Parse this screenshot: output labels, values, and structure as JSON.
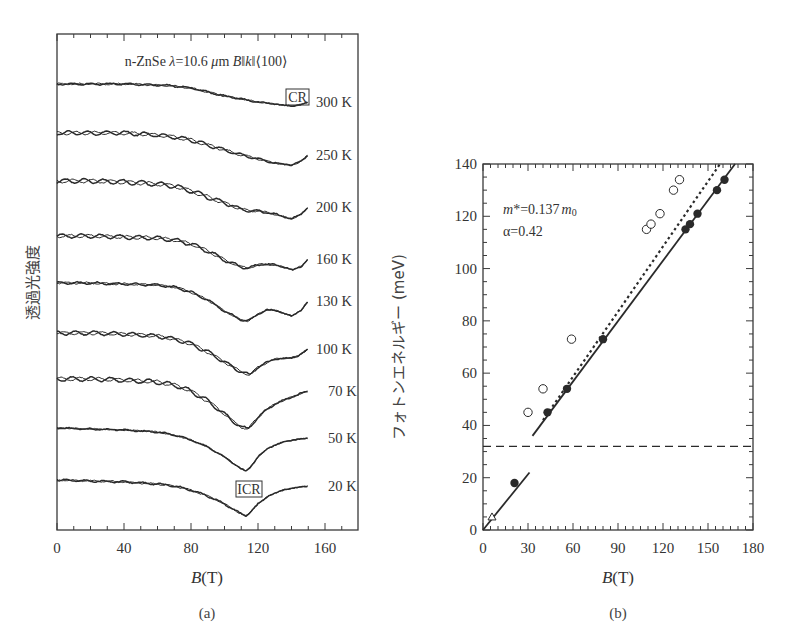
{
  "chart_data": [
    {
      "panel": "(a)",
      "type": "line",
      "title": "n-ZnSe λ=10.6 μm B‖k‖⟨100⟩",
      "xlabel": "B(T)",
      "ylabel": "透過光強度",
      "xlim": [
        0,
        175
      ],
      "xticks": [
        0,
        40,
        80,
        120,
        160
      ],
      "grid": false,
      "annotations": [
        "CR",
        "ICR"
      ],
      "series": [
        {
          "name": "300 K",
          "baseline_y": 84,
          "dips": [
            {
              "B": 140,
              "depth": 22
            }
          ],
          "x": [
            0,
            20,
            40,
            60,
            70,
            80,
            90,
            100,
            110,
            120,
            130,
            140,
            145,
            150
          ],
          "rel": [
            0,
            0,
            0,
            -1,
            -2,
            -4,
            -8,
            -12,
            -15,
            -18,
            -20,
            -22,
            -21,
            -18
          ]
        },
        {
          "name": "250 K",
          "baseline_y": 133,
          "dips": [
            {
              "B": 140,
              "depth": 32
            }
          ],
          "x": [
            0,
            20,
            40,
            60,
            70,
            80,
            90,
            100,
            110,
            120,
            130,
            140,
            145,
            150
          ],
          "rel": [
            0,
            0,
            0,
            -2,
            -4,
            -7,
            -12,
            -17,
            -22,
            -26,
            -30,
            -32,
            -29,
            -22
          ]
        },
        {
          "name": "200 K",
          "baseline_y": 181,
          "dips": [
            {
              "B": 115,
              "depth": 30
            },
            {
              "B": 140,
              "depth": 38
            }
          ],
          "x": [
            0,
            20,
            40,
            60,
            70,
            80,
            90,
            100,
            110,
            115,
            120,
            130,
            140,
            145,
            150
          ],
          "rel": [
            0,
            0,
            -1,
            -3,
            -5,
            -10,
            -16,
            -22,
            -28,
            -30,
            -30,
            -33,
            -38,
            -34,
            -26
          ]
        },
        {
          "name": "160 K",
          "baseline_y": 236,
          "dips": [
            {
              "B": 114,
              "depth": 32
            },
            {
              "B": 141,
              "depth": 34
            }
          ],
          "x": [
            0,
            20,
            40,
            60,
            70,
            80,
            90,
            100,
            110,
            114,
            120,
            125,
            130,
            135,
            141,
            146,
            150
          ],
          "rel": [
            0,
            0,
            -1,
            -2,
            -4,
            -8,
            -15,
            -24,
            -31,
            -32,
            -29,
            -28,
            -29,
            -31,
            -34,
            -30,
            -23
          ]
        },
        {
          "name": "130 K",
          "baseline_y": 283,
          "dips": [
            {
              "B": 114,
              "depth": 38
            },
            {
              "B": 140,
              "depth": 33
            }
          ],
          "x": [
            0,
            20,
            40,
            60,
            70,
            80,
            90,
            100,
            110,
            114,
            120,
            125,
            130,
            135,
            140,
            146,
            150
          ],
          "rel": [
            0,
            0,
            -1,
            -2,
            -4,
            -9,
            -17,
            -28,
            -37,
            -38,
            -31,
            -27,
            -27,
            -30,
            -33,
            -27,
            -18
          ]
        },
        {
          "name": "100 K",
          "baseline_y": 333,
          "dips": [
            {
              "B": 115,
              "depth": 42
            }
          ],
          "x": [
            0,
            20,
            40,
            60,
            70,
            80,
            90,
            100,
            110,
            115,
            120,
            130,
            140,
            145,
            150
          ],
          "rel": [
            0,
            0,
            -1,
            -3,
            -6,
            -11,
            -19,
            -29,
            -39,
            -42,
            -34,
            -26,
            -25,
            -22,
            -16
          ]
        },
        {
          "name": "70 K",
          "baseline_y": 379,
          "dips": [
            {
              "B": 114,
              "depth": 50
            }
          ],
          "x": [
            0,
            20,
            40,
            60,
            70,
            80,
            90,
            100,
            105,
            110,
            114,
            118,
            124,
            130,
            140,
            150
          ],
          "rel": [
            0,
            0,
            -1,
            -3,
            -6,
            -12,
            -22,
            -35,
            -42,
            -48,
            -50,
            -42,
            -32,
            -25,
            -18,
            -12
          ]
        },
        {
          "name": "50 K",
          "baseline_y": 428,
          "dips": [
            {
              "B": 113,
              "depth": 43
            }
          ],
          "x": [
            0,
            20,
            40,
            60,
            70,
            80,
            90,
            100,
            105,
            110,
            113,
            116,
            120,
            126,
            135,
            145,
            150
          ],
          "rel": [
            0,
            -1,
            -2,
            -4,
            -7,
            -12,
            -19,
            -29,
            -35,
            -41,
            -43,
            -38,
            -29,
            -20,
            -14,
            -11,
            -10
          ]
        },
        {
          "name": "20 K",
          "baseline_y": 480,
          "dips": [
            {
              "B": 113,
              "depth": 36
            }
          ],
          "x": [
            0,
            20,
            40,
            60,
            70,
            80,
            90,
            100,
            105,
            110,
            113,
            116,
            120,
            126,
            135,
            145,
            150
          ],
          "rel": [
            0,
            -1,
            -2,
            -4,
            -6,
            -10,
            -16,
            -24,
            -29,
            -34,
            -36,
            -31,
            -24,
            -16,
            -10,
            -7,
            -6
          ]
        }
      ]
    },
    {
      "panel": "(b)",
      "type": "scatter",
      "xlabel": "B(T)",
      "ylabel": "フォトンエネルギー (meV)",
      "xlim": [
        0,
        180
      ],
      "ylim": [
        0,
        140
      ],
      "xticks": [
        0,
        30,
        60,
        90,
        120,
        150,
        180
      ],
      "yticks": [
        0,
        20,
        40,
        60,
        80,
        100,
        120,
        140
      ],
      "grid": false,
      "annotations": [
        "m*=0.137m₀",
        "α=0.42"
      ],
      "series": [
        {
          "name": "filled circles",
          "marker": "filled-circle",
          "points": [
            [
              21,
              18
            ],
            [
              43,
              45
            ],
            [
              56,
              54
            ],
            [
              80,
              73
            ],
            [
              135,
              115
            ],
            [
              138,
              117
            ],
            [
              143,
              121
            ],
            [
              156,
              130
            ],
            [
              161,
              134
            ]
          ]
        },
        {
          "name": "open circles",
          "marker": "open-circle",
          "points": [
            [
              30,
              45
            ],
            [
              40,
              54
            ],
            [
              59,
              73
            ],
            [
              109,
              115
            ],
            [
              112,
              117
            ],
            [
              118,
              121
            ],
            [
              127,
              130
            ],
            [
              131,
              134
            ]
          ]
        },
        {
          "name": "open triangle",
          "marker": "open-triangle",
          "points": [
            [
              6,
              5
            ]
          ]
        },
        {
          "name": "solid line (low)",
          "style": "solid",
          "points": [
            [
              0,
              0
            ],
            [
              31,
              22
            ]
          ]
        },
        {
          "name": "solid line (high)",
          "style": "solid",
          "points": [
            [
              33,
              36
            ],
            [
              168,
              140
            ]
          ]
        },
        {
          "name": "dotted line",
          "style": "dotted",
          "points": [
            [
              40,
              42
            ],
            [
              158,
              140
            ]
          ]
        },
        {
          "name": "dashed horizontal",
          "style": "dashed",
          "points": [
            [
              0,
              32
            ],
            [
              180,
              32
            ]
          ]
        }
      ]
    }
  ],
  "labels": {
    "panel_a": {
      "title_prefix": "n-ZnSe ",
      "title_lambda": "λ",
      "title_mid": "=10.6 ",
      "title_mu": "μ",
      "title_m": "m ",
      "title_B": "B",
      "title_par1": "‖",
      "title_k": "k",
      "title_par2": "‖⟨100⟩",
      "ylabel": "透過光強度",
      "xlabel_var": "B",
      "xlabel_unit": "(T)",
      "caption": "(a)",
      "cr_box": "CR",
      "icr_box": "ICR",
      "xtick_labels": [
        "0",
        "40",
        "80",
        "120",
        "160"
      ],
      "temps": [
        "300 K",
        "250 K",
        "200 K",
        "160 K",
        "130 K",
        "100 K",
        "70 K",
        "50 K",
        "20 K"
      ]
    },
    "panel_b": {
      "ylabel": "フォトンエネルギー (meV)",
      "xlabel_var": "B",
      "xlabel_unit": "(T)",
      "caption": "(b)",
      "ann_m_var": "m",
      "ann_m_rest": "*=0.137",
      "ann_m_sub": "m",
      "ann_m_zero": "0",
      "ann_alpha": "α=0.42",
      "xtick_labels": [
        "0",
        "30",
        "60",
        "90",
        "120",
        "150",
        "180"
      ],
      "ytick_labels": [
        "0",
        "20",
        "40",
        "60",
        "80",
        "100",
        "120",
        "140"
      ]
    }
  },
  "colors": {
    "ink": "#2a2a2a",
    "frame": "#3a3a3a",
    "background": "#ffffff"
  }
}
